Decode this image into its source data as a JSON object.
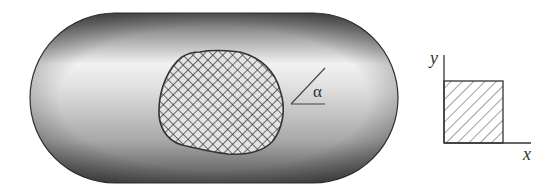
{
  "figure": {
    "capsule": {
      "fill_light": "#f4f4f4",
      "fill_dark": "#6e6e6e",
      "stroke": "#333333"
    },
    "region": {
      "pattern": "crosshatch",
      "stroke": "#333333"
    },
    "angle": {
      "label": "α"
    },
    "axes": {
      "x_label": "x",
      "y_label": "y",
      "square_pattern": "diagonal-hatch"
    }
  }
}
